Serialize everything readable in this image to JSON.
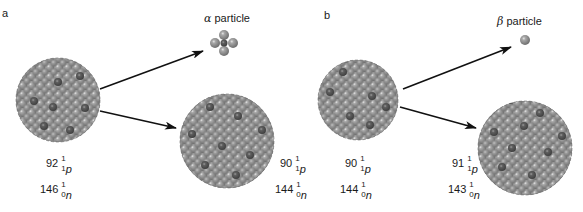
{
  "panels": [
    {
      "id": "a",
      "label": "a",
      "emitted_particle": {
        "greek": "α",
        "word": "particle",
        "type": "alpha"
      },
      "parent": {
        "protons": {
          "count": "92",
          "mass": "1",
          "atomic": "1",
          "symbol": "p"
        },
        "neutrons": {
          "count": "146",
          "mass": "1",
          "atomic": "0",
          "symbol": "n"
        }
      },
      "daughter": {
        "protons": {
          "count": "90",
          "mass": "1",
          "atomic": "1",
          "symbol": "p"
        },
        "neutrons": {
          "count": "144",
          "mass": "1",
          "atomic": "0",
          "symbol": "n"
        }
      }
    },
    {
      "id": "b",
      "label": "b",
      "emitted_particle": {
        "greek": "β",
        "word": "particle",
        "type": "beta"
      },
      "parent": {
        "protons": {
          "count": "90",
          "mass": "1",
          "atomic": "1",
          "symbol": "p"
        },
        "neutrons": {
          "count": "144",
          "mass": "1",
          "atomic": "0",
          "symbol": "n"
        }
      },
      "daughter": {
        "protons": {
          "count": "91",
          "mass": "1",
          "atomic": "1",
          "symbol": "p"
        },
        "neutrons": {
          "count": "143",
          "mass": "1",
          "atomic": "0",
          "symbol": "n"
        }
      }
    }
  ],
  "colors": {
    "nucleon_light": "#a8a8a8",
    "nucleon_mid": "#858585",
    "nucleon_dark": "#5a5a5a",
    "highlight": "#e6e6e6",
    "arrow": "#111111",
    "text": "#1a1a1a"
  }
}
